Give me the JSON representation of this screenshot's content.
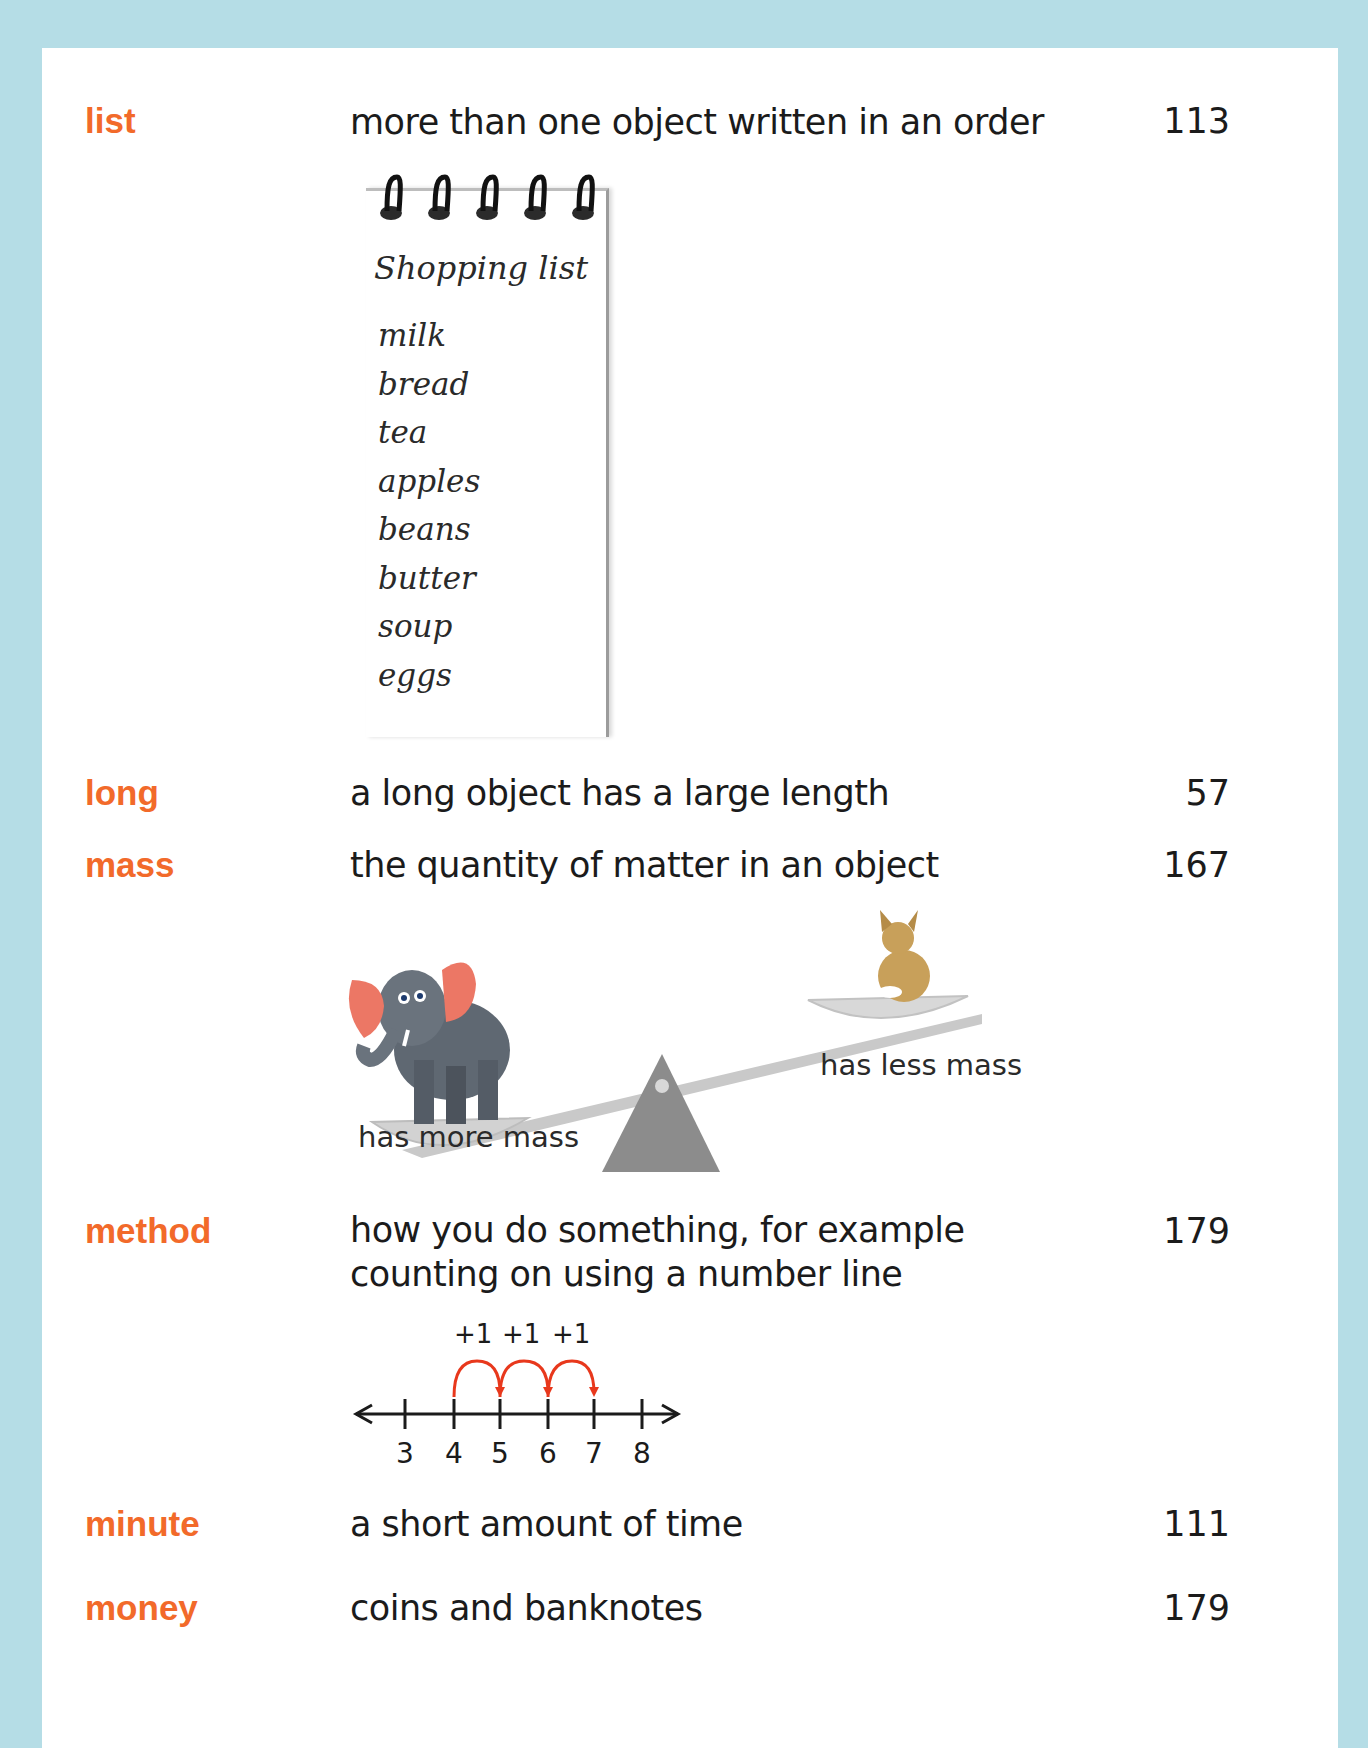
{
  "colors": {
    "background": "#b5dde6",
    "page": "#ffffff",
    "term": "#f26a2a",
    "text": "#1b1b1b",
    "jump_arrow": "#e8381c"
  },
  "entries": [
    {
      "term": "list",
      "definition": "more than one object written in an order",
      "page": "113"
    },
    {
      "term": "long",
      "definition": "a long object has a large length",
      "page": "57"
    },
    {
      "term": "mass",
      "definition": "the quantity of matter in an object",
      "page": "167"
    },
    {
      "term": "method",
      "definition": "how you do something, for example counting on using a number line",
      "page": "179"
    },
    {
      "term": "minute",
      "definition": "a short amount of time",
      "page": "111"
    },
    {
      "term": "money",
      "definition": "coins and banknotes",
      "page": "179"
    }
  ],
  "shopping_list": {
    "title": "Shopping list",
    "items": [
      "milk",
      "bread",
      "tea",
      "apples",
      "beans",
      "butter",
      "soup",
      "eggs"
    ]
  },
  "mass_illustration": {
    "heavy_label": "has more mass",
    "light_label": "has less mass",
    "heavy_icon": "elephant-icon",
    "light_icon": "cat-icon"
  },
  "number_line": {
    "ticks": [
      "3",
      "4",
      "5",
      "6",
      "7",
      "8"
    ],
    "jumps": [
      "+1",
      "+1",
      "+1"
    ],
    "start": 4,
    "end": 7
  }
}
